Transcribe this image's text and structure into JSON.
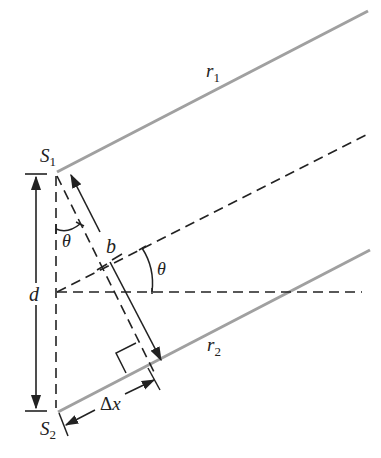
{
  "diagram": {
    "labels": {
      "s1": "S",
      "s1_sub": "1",
      "s2": "S",
      "s2_sub": "2",
      "r1": "r",
      "r1_sub": "1",
      "r2": "r",
      "r2_sub": "2",
      "d": "d",
      "b": "b",
      "theta_top": "θ",
      "theta_mid": "θ",
      "delta": "Δ",
      "delta_x": "x"
    },
    "colors": {
      "ray": "#a0a0a0",
      "ink": "#222222",
      "background": "#ffffff"
    },
    "elements": [
      "ray r1 from S1",
      "ray r2 from S2",
      "dashed center line at angle theta",
      "dashed horizontal reference line",
      "dashed vertical line S1-S2",
      "dashed perpendicular from S1 to r2",
      "dimension arrow d",
      "dimension arrow b",
      "dimension arrow delta x",
      "right-angle marker"
    ]
  }
}
